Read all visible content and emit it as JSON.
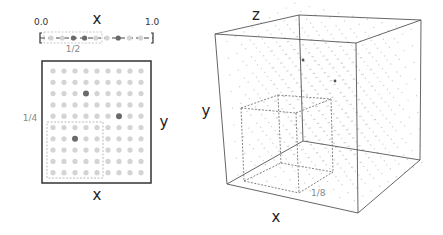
{
  "panel_1d": {
    "axis_label": "x",
    "range_min_label": "0.0",
    "range_max_label": "1.0",
    "subregion_label": "1/2",
    "points": 9,
    "highlighted_indices": [
      2,
      3,
      6
    ]
  },
  "panel_2d": {
    "x_label": "x",
    "y_label": "y",
    "subregion_label": "1/4",
    "grid_cols": 9,
    "grid_rows": 10,
    "highlighted_cells": [
      [
        3,
        2
      ],
      [
        6,
        4
      ],
      [
        2,
        6
      ]
    ]
  },
  "panel_3d": {
    "x_label": "x",
    "y_label": "y",
    "z_label": "z",
    "subregion_label": "1/8"
  },
  "colors": {
    "point_light": "#d4d4d4",
    "point_dark": "#6a6a6a",
    "frame": "#444444",
    "dashed": "#999999"
  }
}
